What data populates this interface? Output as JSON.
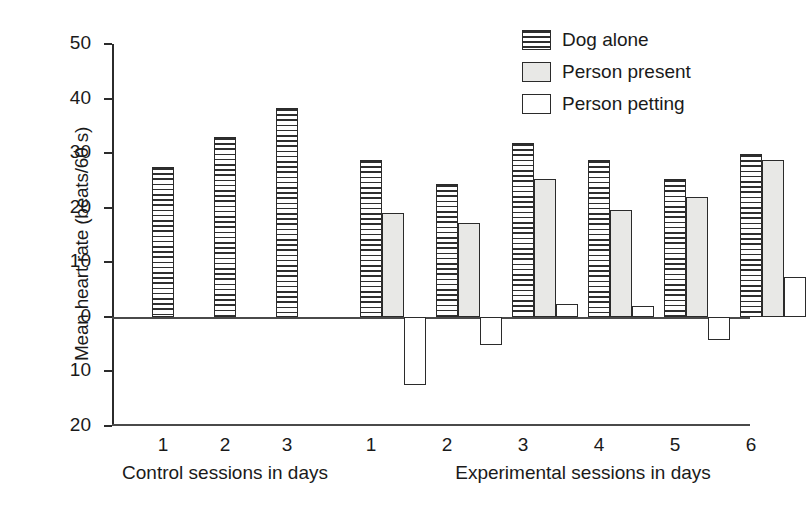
{
  "chart_data": {
    "type": "bar",
    "title": "",
    "xlabel": "",
    "ylabel": "Mean heart rate (beats/60 s)",
    "ylim": [
      -20,
      50
    ],
    "ytick_values": [
      50,
      40,
      30,
      20,
      10,
      0,
      -10,
      -20
    ],
    "ytick_labels": [
      "50",
      "40",
      "30",
      "20",
      "10",
      "0",
      "10",
      "20"
    ],
    "grid": false,
    "legend_position": "top-right",
    "zero_line": true,
    "groups": [
      {
        "name": "Control sessions in days",
        "categories": [
          "1",
          "2",
          "3"
        ]
      },
      {
        "name": "Experimental sessions in days",
        "categories": [
          "1",
          "2",
          "3",
          "4",
          "5",
          "6"
        ]
      }
    ],
    "series": [
      {
        "name": "Dog alone",
        "fill": "horizontal-lines",
        "control_values": [
          27.5,
          33.0,
          38.2
        ],
        "experimental_values": [
          28.7,
          24.4,
          31.9,
          28.8,
          25.2,
          29.9
        ]
      },
      {
        "name": "Person present",
        "fill": "light-gray",
        "control_values": [
          null,
          null,
          null
        ],
        "experimental_values": [
          19.1,
          17.2,
          25.3,
          19.5,
          22.0,
          28.7
        ]
      },
      {
        "name": "Person petting",
        "fill": "white",
        "control_values": [
          null,
          null,
          null
        ],
        "experimental_values": [
          -12.5,
          -5.2,
          2.3,
          2.0,
          -4.2,
          7.3
        ]
      }
    ]
  },
  "legend": {
    "items": [
      {
        "label": "Dog alone",
        "swatch": "horizontal-lines"
      },
      {
        "label": "Person present",
        "swatch": "light-gray"
      },
      {
        "label": "Person petting",
        "swatch": "white"
      }
    ]
  },
  "axes": {
    "y_title": "Mean heart rate (beats/60 s)",
    "y_labels": [
      "50",
      "40",
      "30",
      "20",
      "10",
      "0",
      "10",
      "20"
    ],
    "control_group_label": "Control sessions in days",
    "experimental_group_label": "Experimental sessions in days",
    "control_ticks": [
      "1",
      "2",
      "3"
    ],
    "experimental_ticks": [
      "1",
      "2",
      "3",
      "4",
      "5",
      "6"
    ]
  },
  "colors": {
    "axis": "#2b2b2b",
    "bar_outline": "#2b2b2b",
    "person_present_fill": "#e8e8e6",
    "person_petting_fill": "#ffffff",
    "background": "#ffffff"
  }
}
